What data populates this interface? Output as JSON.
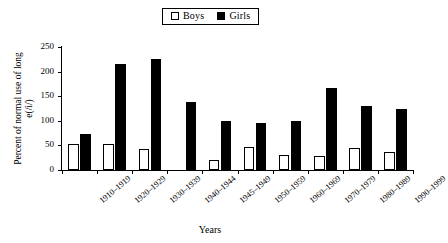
{
  "chart_data": {
    "type": "bar",
    "title": "",
    "subtitle": "",
    "xlabel": "Years",
    "ylabel": "Percent of normal use of long e(/i/)",
    "ylim": [
      0,
      250
    ],
    "yticks": [
      0,
      50,
      100,
      150,
      200,
      250
    ],
    "grid": false,
    "legend_position": "top-center",
    "categories": [
      "1910–1919",
      "1920–1929",
      "1930–1939",
      "1940–1944",
      "1945–1949",
      "1950–1959",
      "1960–1969",
      "1970–1979",
      "1980–1989",
      "1990–1999"
    ],
    "series": [
      {
        "name": "Boys",
        "fill": "#ffffff",
        "stroke": "#000000",
        "values": [
          52,
          52,
          42,
          0,
          21,
          47,
          31,
          29,
          45,
          37
        ]
      },
      {
        "name": "Girls",
        "fill": "#000000",
        "stroke": "#000000",
        "values": [
          74,
          215,
          225,
          139,
          100,
          96,
          100,
          166,
          131,
          123
        ]
      }
    ]
  },
  "legend": {
    "entries": [
      {
        "label": "Boys",
        "swatch": "open-square-swatch"
      },
      {
        "label": "Girls",
        "swatch": "solid-square-swatch"
      }
    ]
  },
  "axes": {
    "y_title": "Percent of normal use of long e(/i/)",
    "x_title": "Years",
    "y_tick_labels": [
      "250",
      "200",
      "150",
      "100",
      "50",
      "0"
    ]
  },
  "colors": {
    "boys": "#ffffff",
    "girls": "#000000",
    "axis": "#000000",
    "background": "#ffffff"
  }
}
